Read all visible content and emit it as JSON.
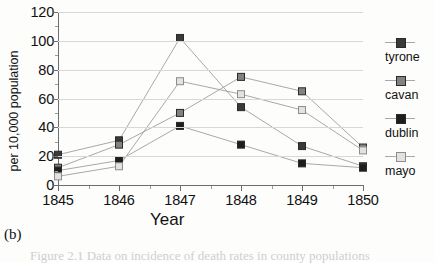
{
  "figure": {
    "panel_label": "(b)",
    "caption_partial": "Figure 2.1  Data on incidence of death rates in county populations"
  },
  "legend": {
    "position": "right",
    "entries": [
      {
        "label": "tyrone",
        "color": "#3a3a3a",
        "marker": "filled-square"
      },
      {
        "label": "cavan",
        "color": "#828282",
        "marker": "filled-square"
      },
      {
        "label": "dublin",
        "color": "#1e1e1e",
        "marker": "filled-square"
      },
      {
        "label": "mayo",
        "color": "#e2e2e2",
        "marker": "open-square"
      }
    ]
  },
  "chart_data": {
    "type": "line",
    "title": "",
    "xlabel": "Year",
    "ylabel": "per 10,000 population",
    "categories": [
      "1845",
      "1846",
      "1847",
      "1848",
      "1849",
      "1850"
    ],
    "x": [
      1845,
      1846,
      1847,
      1848,
      1849,
      1850
    ],
    "xlim": [
      1845,
      1850
    ],
    "ylim": [
      0,
      120
    ],
    "yticks": [
      0,
      20,
      40,
      60,
      80,
      100,
      120
    ],
    "ytick_labels": [
      "0",
      "20",
      "40",
      "60",
      "80",
      "100",
      "120"
    ],
    "grid": true,
    "grid_axis": "y",
    "minor_ticks": true,
    "legend_position": "right",
    "series": [
      {
        "name": "tyrone",
        "color": "#3a3a3a",
        "values": [
          21,
          31,
          102,
          54,
          27,
          13
        ]
      },
      {
        "name": "cavan",
        "color": "#828282",
        "values": [
          12,
          28,
          50,
          75,
          65,
          26
        ]
      },
      {
        "name": "dublin",
        "color": "#1e1e1e",
        "values": [
          10,
          17,
          41,
          28,
          15,
          12
        ]
      },
      {
        "name": "mayo",
        "color": "#e2e2e2",
        "values": [
          6,
          13,
          72,
          63,
          52,
          24
        ]
      }
    ]
  }
}
